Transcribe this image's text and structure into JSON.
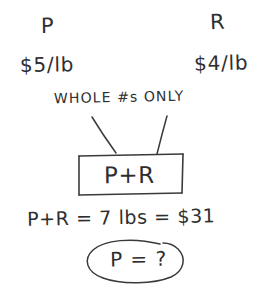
{
  "page": {
    "background_color": "#ffffff",
    "ink_color": "#2e2e31"
  },
  "labels": {
    "variable_p": "P",
    "variable_r": "R"
  },
  "prices": {
    "p_unit_price": "$5/lb",
    "r_unit_price": "$4/lb"
  },
  "constraint": {
    "note": "WHOLE #s ONLY"
  },
  "box": {
    "label": "P+R"
  },
  "equation": {
    "text": "P+R  =  7 lbs  =  $31",
    "left_side": "P+R",
    "total_weight": "7 lbs",
    "total_cost": "$31"
  },
  "question": {
    "text": "P = ?"
  },
  "annotations": {
    "leader_line_left": "line from WHOLE #s note down to the P+R box",
    "leader_line_right": "line from ONLY note down to the P+R box",
    "oval": "hand-drawn oval circling the unknown"
  }
}
